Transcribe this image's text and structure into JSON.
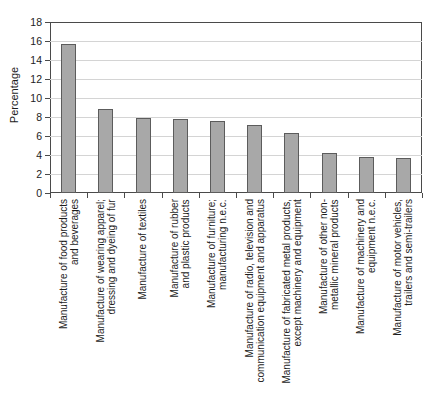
{
  "chart_data": {
    "type": "bar",
    "title": "",
    "xlabel": "",
    "ylabel": "Percentage",
    "ylim": [
      0,
      18
    ],
    "ytick_step": 2,
    "grid": "horizontal",
    "legend": "none",
    "style": {
      "bar_fill": "#a8a8a8",
      "bar_border": "#5c5c5c",
      "gridline_color": "#d4d4d4",
      "axis_color": "#4a4a4a",
      "text_color": "#1c1c1c",
      "background": "#ffffff"
    },
    "categories": [
      "Manufacture of food products\nand beverages",
      "Manufacture of wearing apparel;\ndressing and dyeing of fur",
      "Manufacture of textiles",
      "Manufacture of rubber\nand plastic products",
      "Manufacture of furniture;\nmanufacturing n.e.c.",
      "Manufacture of radio, television and\ncommunication equipment and apparatus",
      "Manufacture of fabricated metal products,\nexcept machinery and equipment",
      "Manufacture of other non-\nmetallic mineral products",
      "Manufacture of machinery and\nequipment n.e.c.",
      "Manufacture of motor vehicles,\ntrailers and semi-trailers"
    ],
    "values": [
      15.7,
      8.8,
      7.9,
      7.8,
      7.6,
      7.2,
      6.3,
      4.2,
      3.8,
      3.7
    ]
  }
}
